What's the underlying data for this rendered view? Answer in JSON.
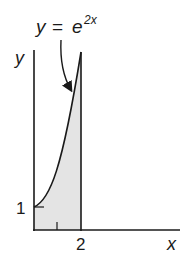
{
  "diagram": {
    "formula": {
      "lhs": "y",
      "eq": "=",
      "base": "e",
      "exponent": "2x"
    },
    "axes": {
      "x_label": "x",
      "y_label": "y"
    },
    "ticks": {
      "y_one": "1",
      "x_two": "2"
    },
    "region": {
      "fill_color": "#e4e4e4",
      "description": "Shaded area under y = e^(2x) from x = 0 to x = 2"
    },
    "colors": {
      "stroke": "#1a1a1a",
      "background": "#ffffff"
    }
  }
}
